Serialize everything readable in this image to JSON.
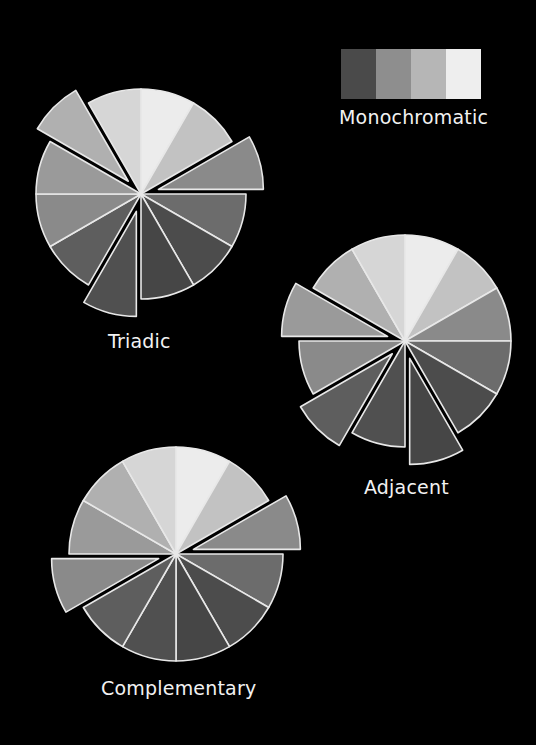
{
  "legend": {
    "title": "Monochromatic",
    "swatches": [
      "#4a4a4a",
      "#8e8e8e",
      "#b6b6b6",
      "#eeeeee"
    ]
  },
  "slice_colors": [
    "#ececec",
    "#c2c2c2",
    "#8a8a8a",
    "#6c6c6c",
    "#4c4c4c",
    "#464646",
    "#505050",
    "#5e5e5e",
    "#8a8a8a",
    "#9a9a9a",
    "#b0b0b0",
    "#d6d6d6"
  ],
  "wheels": [
    {
      "name": "triadic",
      "label": "Triadic",
      "center": [
        141,
        194
      ],
      "radius": 105,
      "explode_offset": 18,
      "exploded_slices": [
        2,
        6,
        10
      ],
      "label_pos": [
        108,
        330
      ]
    },
    {
      "name": "adjacent",
      "label": "Adjacent",
      "center": [
        405,
        341
      ],
      "radius": 106,
      "explode_offset": 18,
      "exploded_slices": [
        5,
        7,
        9
      ],
      "label_pos": [
        364,
        476
      ]
    },
    {
      "name": "complementary",
      "label": "Complementary",
      "center": [
        176,
        554
      ],
      "radius": 107,
      "explode_offset": 18,
      "exploded_slices": [
        2,
        8
      ],
      "label_pos": [
        101,
        677
      ]
    }
  ]
}
